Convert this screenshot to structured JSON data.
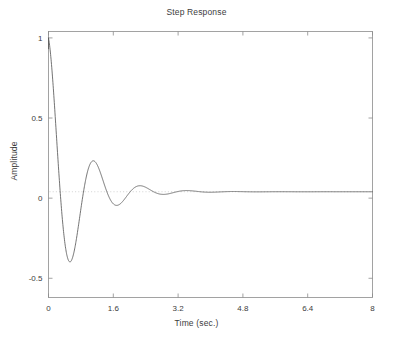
{
  "figure": {
    "title": "Step Response",
    "xlabel": "Time (sec.)",
    "ylabel": "Amplitude"
  },
  "chart_data": {
    "type": "line",
    "title": "Step Response",
    "xlabel": "Time (sec.)",
    "ylabel": "Amplitude",
    "xlim": [
      0,
      8
    ],
    "ylim": [
      -0.62,
      1.04
    ],
    "grid": false,
    "legend": null,
    "xticks": [
      0,
      1.6,
      3.2,
      4.8,
      6.4,
      8
    ],
    "xtick_labels": [
      "0",
      "1.6",
      "3.2",
      "4.8",
      "6.4",
      "8"
    ],
    "yticks": [
      -0.5,
      0,
      0.5,
      1
    ],
    "ytick_labels": [
      "-0.5",
      "0",
      "0.5",
      "1"
    ],
    "line_color": "#5a5a5a",
    "reference_line": {
      "value": 0.04,
      "style": "dotted",
      "color": "#c8c8c8"
    },
    "series": [
      {
        "name": "step response",
        "description": "Lightly damped oscillatory step response starting at amplitude 1 at t=0, decaying with ringing toward a steady-state value near 0.04",
        "model": {
          "steady_state": 0.04,
          "initial_value": 1.0,
          "envelope_amplitude": 0.96,
          "decay_rate": 1.42,
          "angular_frequency": 5.45,
          "phase": 0.0
        },
        "x": [
          0.0,
          0.1,
          0.2,
          0.3,
          0.4,
          0.5,
          0.6,
          0.7,
          0.8,
          0.9,
          1.0,
          1.1,
          1.2,
          1.3,
          1.4,
          1.5,
          1.6,
          1.7,
          1.8,
          1.9,
          2.0,
          2.2,
          2.4,
          2.6,
          2.8,
          3.0,
          3.2,
          3.4,
          3.6,
          3.8,
          4.0,
          4.2,
          4.4,
          4.6,
          4.8,
          5.0,
          5.2,
          5.4,
          5.6,
          5.8,
          6.0,
          6.4,
          6.8,
          7.2,
          7.6,
          8.0
        ],
        "y": [
          1.0,
          0.69,
          0.26,
          -0.15,
          -0.43,
          -0.54,
          -0.49,
          -0.3,
          -0.06,
          0.19,
          0.36,
          0.43,
          0.4,
          0.29,
          0.13,
          -0.03,
          -0.15,
          -0.2,
          -0.2,
          -0.15,
          -0.06,
          0.13,
          0.18,
          0.11,
          -0.01,
          -0.06,
          -0.05,
          0.02,
          0.08,
          0.09,
          0.05,
          0.0,
          -0.01,
          0.01,
          0.04,
          0.06,
          0.06,
          0.04,
          0.02,
          0.02,
          0.03,
          0.04,
          0.04,
          0.03,
          0.04,
          0.04
        ],
        "key_points": [
          {
            "label": "initial",
            "x": 0.0,
            "y": 1.0
          },
          {
            "label": "first undershoot",
            "x": 0.55,
            "y": -0.55
          },
          {
            "label": "second overshoot",
            "x": 1.12,
            "y": 0.43
          },
          {
            "label": "second undershoot",
            "x": 1.73,
            "y": -0.2
          },
          {
            "label": "third overshoot",
            "x": 2.3,
            "y": 0.19
          },
          {
            "label": "third undershoot",
            "x": 2.92,
            "y": -0.06
          },
          {
            "label": "fourth overshoot",
            "x": 3.72,
            "y": 0.09
          },
          {
            "label": "settled",
            "x": 8.0,
            "y": 0.04
          }
        ]
      }
    ]
  }
}
